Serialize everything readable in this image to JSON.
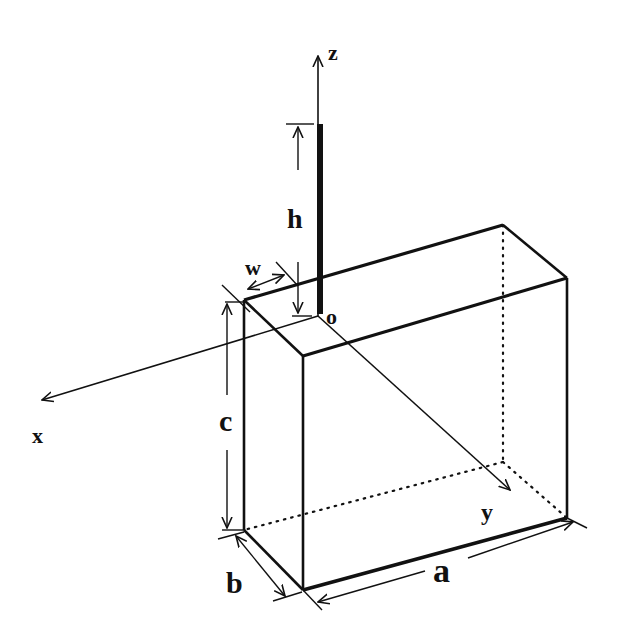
{
  "diagram": {
    "axes": {
      "x": "x",
      "y": "y",
      "z": "z",
      "origin": "o"
    },
    "dimensions": {
      "a": "a",
      "b": "b",
      "c": "c",
      "h": "h",
      "w": "w"
    },
    "colors": {
      "line": "#111111",
      "background": "#ffffff"
    }
  }
}
